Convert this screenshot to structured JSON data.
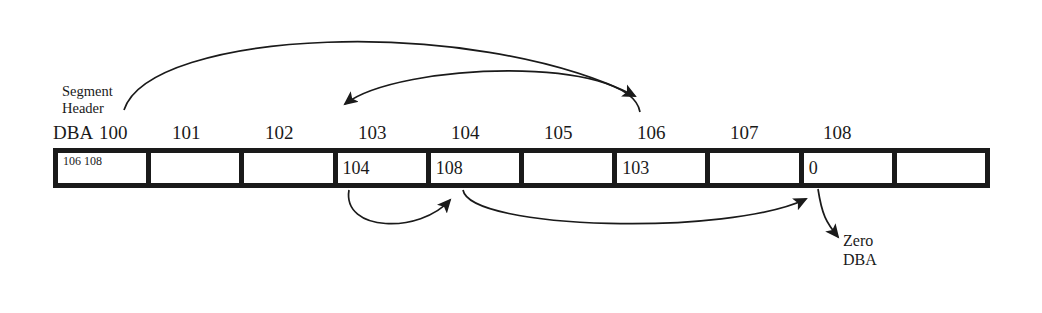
{
  "diagram": {
    "callout_segment_header": {
      "line1": "Segment",
      "line2": "Header"
    },
    "dba_row": {
      "prefix": "DBA",
      "ticks": [
        "100",
        "101",
        "102",
        "103",
        "104",
        "105",
        "106",
        "107",
        "108"
      ]
    },
    "blocks": [
      {
        "dba": "100",
        "value": "106 108"
      },
      {
        "dba": "101",
        "value": ""
      },
      {
        "dba": "102",
        "value": ""
      },
      {
        "dba": "103",
        "value": "104"
      },
      {
        "dba": "104",
        "value": "108"
      },
      {
        "dba": "105",
        "value": ""
      },
      {
        "dba": "106",
        "value": "103"
      },
      {
        "dba": "107",
        "value": ""
      },
      {
        "dba": "108",
        "value": "0"
      },
      {
        "dba": "",
        "value": ""
      }
    ],
    "annotation_zero_dba": {
      "line1": "Zero",
      "line2": "DBA"
    },
    "arrows": [
      {
        "name": "header-to-106",
        "from": "Segment Header",
        "to": "DBA 106"
      },
      {
        "name": "106-to-103",
        "from": "DBA 106",
        "to": "DBA 103"
      },
      {
        "name": "103-to-104",
        "from": "block 103",
        "to": "block 104"
      },
      {
        "name": "104-to-108",
        "from": "block 104",
        "to": "block 108"
      },
      {
        "name": "108-to-zero-dba",
        "from": "block 108",
        "to": "Zero DBA"
      }
    ],
    "colors": {
      "ink": "#1a1a1a",
      "background": "#ffffff"
    }
  }
}
